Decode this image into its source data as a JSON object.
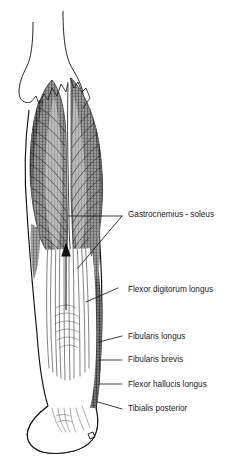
{
  "figure": {
    "colors": {
      "ink": "#1a1a1a",
      "outline": "#111111",
      "muscle_mid_gray": "#8a8a8a",
      "muscle_dark": "#3f3f3f",
      "muscle_light": "#b4b4b4",
      "background": "#ffffff"
    },
    "labels": [
      {
        "id": "gastrocnemius-soleus",
        "text": "Gastrocnemius - soleus",
        "x": 128,
        "y": 215,
        "leader_type": "branched-v"
      },
      {
        "id": "flexor-digitorum-longus",
        "text": "Flexor digitorum longus",
        "x": 128,
        "y": 290,
        "leader_type": "diagonal"
      },
      {
        "id": "fibularis-longus",
        "text": "Fibularis longus",
        "x": 128,
        "y": 337,
        "leader_type": "diagonal"
      },
      {
        "id": "fibularis-brevis",
        "text": "Fibularis brevis",
        "x": 128,
        "y": 360,
        "leader_type": "horizontal"
      },
      {
        "id": "flexor-hallucis-longus",
        "text": "Flexor hallucis longus",
        "x": 128,
        "y": 385,
        "leader_type": "horizontal"
      },
      {
        "id": "tibialis-posterior",
        "text": "Tibialis posterior",
        "x": 128,
        "y": 409,
        "leader_type": "diagonal"
      }
    ],
    "annotations": [
      {
        "id": "direction-arrow",
        "type": "arrow",
        "direction": "up"
      }
    ]
  }
}
